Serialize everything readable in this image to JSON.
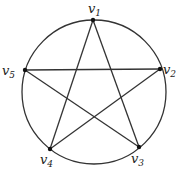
{
  "diagram": {
    "type": "graph",
    "circle": {
      "cx": 94,
      "cy": 92,
      "r": 72
    },
    "vertices": [
      {
        "id": "v1",
        "base": "v",
        "sub": "1",
        "x": 93,
        "y": 20,
        "lx": 88,
        "ly": 13
      },
      {
        "id": "v2",
        "base": "v",
        "sub": "2",
        "x": 160,
        "y": 69,
        "lx": 163,
        "ly": 74
      },
      {
        "id": "v3",
        "base": "v",
        "sub": "3",
        "x": 139,
        "y": 147,
        "lx": 131,
        "ly": 163
      },
      {
        "id": "v4",
        "base": "v",
        "sub": "4",
        "x": 50,
        "y": 149,
        "lx": 40,
        "ly": 164
      },
      {
        "id": "v5",
        "base": "v",
        "sub": "5",
        "x": 25,
        "y": 70,
        "lx": 2,
        "ly": 75
      }
    ],
    "edges": [
      [
        "v1",
        "v3"
      ],
      [
        "v1",
        "v4"
      ],
      [
        "v2",
        "v5"
      ],
      [
        "v2",
        "v4"
      ],
      [
        "v5",
        "v3"
      ]
    ],
    "colors": {
      "stroke": "#333333",
      "vertex": "#111111"
    }
  }
}
